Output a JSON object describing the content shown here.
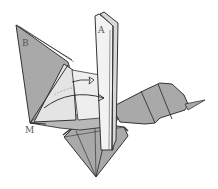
{
  "diagram": {
    "type": "origami-folding-step",
    "labels": {
      "a": "A",
      "b": "B",
      "m": "M"
    },
    "arrows": [
      {
        "kind": "valley-fold-arrow",
        "from": "left flap (B)",
        "to": "center"
      },
      {
        "kind": "push-arrow",
        "from": "left flap",
        "to": "center layers"
      }
    ],
    "colors": {
      "paper_gray": "#a9a9a9",
      "paper_light": "#dcdcdc",
      "paper_white": "#f0f0f0",
      "outline": "#333333",
      "background": "#ffffff"
    }
  }
}
